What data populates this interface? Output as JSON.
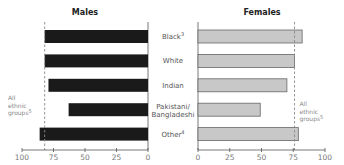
{
  "chart_data": [
    {
      "type": "bar",
      "orientation": "horizontal",
      "direction": "right-to-left",
      "title": "Males",
      "categories": [
        "Black",
        "White",
        "Indian",
        "Pakistani/ Bangladeshi",
        "Other"
      ],
      "category_superscripts": [
        "3",
        "",
        "",
        "",
        "4"
      ],
      "values": [
        82,
        82,
        79,
        63,
        86
      ],
      "xlim": [
        0,
        100
      ],
      "xticks": [
        100,
        75,
        50,
        25,
        0
      ],
      "bar_color": "#1a1a1a",
      "reference_line": {
        "label_lines": [
          "All",
          "ethnic",
          "groups"
        ],
        "label_superscript": "5",
        "value": 82,
        "style": "dashed"
      },
      "grid": false,
      "legend": "none"
    },
    {
      "type": "bar",
      "orientation": "horizontal",
      "direction": "left-to-right",
      "title": "Females",
      "categories": [
        "Black",
        "White",
        "Indian",
        "Pakistani/ Bangladeshi",
        "Other"
      ],
      "category_superscripts": [
        "3",
        "",
        "",
        "",
        "4"
      ],
      "values": [
        82,
        76,
        70,
        49,
        79
      ],
      "xlim": [
        0,
        100
      ],
      "xticks": [
        0,
        25,
        50,
        75,
        100
      ],
      "bar_color": "#c8c8c8",
      "bar_stroke": "#666666",
      "reference_line": {
        "label_lines": [
          "All",
          "ethnic",
          "groups"
        ],
        "label_superscript": "5",
        "value": 76,
        "style": "dashed"
      },
      "grid": false,
      "legend": "none"
    }
  ]
}
